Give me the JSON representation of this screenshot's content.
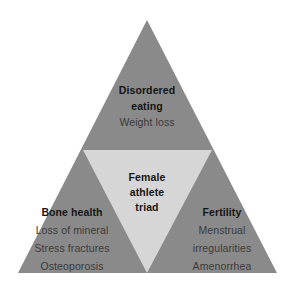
{
  "diagram": {
    "type": "triangle-venn",
    "title_center": "Female athlete triad",
    "colors": {
      "outer_triangle": "#8a8a8a",
      "inner_triangle": "#d6d6d6",
      "background": "#ffffff",
      "heading_text": "#151515",
      "body_text": "#3a3a3a"
    },
    "geometry": {
      "apex": [
        147,
        20
      ],
      "base_left": [
        18,
        273
      ],
      "base_right": [
        277,
        273
      ],
      "inner_top_left": [
        83,
        150
      ],
      "inner_top_right": [
        212,
        150
      ],
      "inner_bottom": [
        147,
        273
      ]
    },
    "center": {
      "lines": [
        "Female",
        "athlete",
        "triad"
      ]
    },
    "corners": [
      {
        "id": "disordered-eating",
        "position": "top",
        "heading_lines": [
          "Disordered",
          "eating"
        ],
        "items": [
          "Weight loss"
        ]
      },
      {
        "id": "bone-health",
        "position": "bottom-left",
        "heading_lines": [
          "Bone health"
        ],
        "items": [
          "Loss of mineral",
          "Stress fractures",
          "Osteoporosis"
        ]
      },
      {
        "id": "fertility",
        "position": "bottom-right",
        "heading_lines": [
          "Fertility"
        ],
        "items": [
          "Menstrual",
          "irregularities",
          "Amenorrhea"
        ]
      }
    ]
  }
}
